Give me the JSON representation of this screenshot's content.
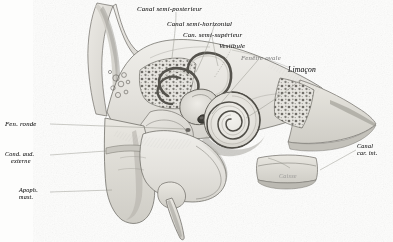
{
  "plate": {
    "title": "Coupe du rocher — oreille interne",
    "medium": "engraving",
    "paper_color": "#fdfdfc",
    "ink_color": "#3a3a3a"
  },
  "labels": {
    "canal_semi_posterieur": "Canal semi-posterieur",
    "canal_semi_horizontal": "Canal semi-horizontal",
    "can_semi_superieur": "Can. semi-supérieur",
    "vestibule": "Vestibule",
    "fenetre_ovale": "Fenêtre ovale",
    "limacon": "Limaçon",
    "fen_ronde": "Fen. ronde",
    "cond_aud_externe_l1": "Cond. aud.",
    "cond_aud_externe_l2": "externe",
    "apoph_mast_l1": "Apoph.",
    "apoph_mast_l2": "mast.",
    "canal_car_int_l1": "Canal",
    "canal_car_int_l2": "car. int.",
    "caisse": "Caisse"
  },
  "features": [
    {
      "name": "mastoid-process",
      "label": "Apoph. mast."
    },
    {
      "name": "external-auditory-canal",
      "label": "Cond. aud. externe"
    },
    {
      "name": "round-window",
      "label": "Fen. ronde"
    },
    {
      "name": "cochlea",
      "label": "Limaçon"
    },
    {
      "name": "oval-window",
      "label": "Fenêtre ovale"
    },
    {
      "name": "vestibule",
      "label": "Vestibule"
    },
    {
      "name": "superior-semicircular-canal",
      "label": "Can. semi-supérieur"
    },
    {
      "name": "horizontal-semicircular-canal",
      "label": "Canal semi-horizontal"
    },
    {
      "name": "posterior-semicircular-canal",
      "label": "Canal semi-posterieur"
    },
    {
      "name": "carotid-canal",
      "label": "Canal car. int."
    },
    {
      "name": "tympanic-cavity",
      "label": "Caisse"
    }
  ]
}
